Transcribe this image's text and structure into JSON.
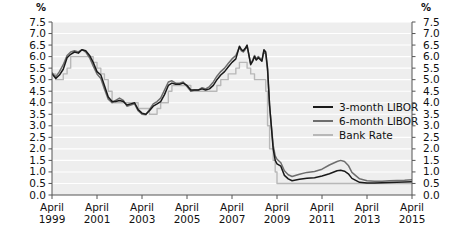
{
  "chart_data": {
    "type": "line",
    "title": "",
    "subtitle": "",
    "xlabel": "",
    "ylabel": "%",
    "ylabel_right": "%",
    "ylim": [
      0.0,
      7.5
    ],
    "xlim": [
      "April 1999",
      "April 2015"
    ],
    "grid": true,
    "legend_position": "inside-right",
    "y_ticks": [
      "7.5",
      "7.0",
      "6.5",
      "6.0",
      "5.5",
      "5.0",
      "4.5",
      "4.0",
      "3.5",
      "3.0",
      "2.5",
      "2.0",
      "1.5",
      "1.0",
      "0.5",
      "0.0"
    ],
    "y_ticks_right": [
      "7.5",
      "7.0",
      "6.5",
      "6.0",
      "5.5",
      "5.0",
      "4.5",
      "4.0",
      "3.5",
      "3.0",
      "2.5",
      "2.0",
      "1.5",
      "1.0",
      "0.5",
      "0.0"
    ],
    "x_ticks": [
      {
        "month": "April",
        "year": "1999"
      },
      {
        "month": "April",
        "year": "2001"
      },
      {
        "month": "April",
        "year": "2003"
      },
      {
        "month": "April",
        "year": "2005"
      },
      {
        "month": "April",
        "year": "2007"
      },
      {
        "month": "April",
        "year": "2009"
      },
      {
        "month": "April",
        "year": "2011"
      },
      {
        "month": "April",
        "year": "2013"
      },
      {
        "month": "April",
        "year": "2015"
      }
    ],
    "colors": {
      "libor_3m": "#1a1a1a",
      "libor_6m": "#6e6e6e",
      "bank_rate": "#b8b8b8",
      "plot_background": "#eeeeee",
      "gridline": "#ffffff",
      "axis": "#555555"
    },
    "x": [
      1999.25,
      1999.42,
      1999.58,
      1999.75,
      1999.92,
      2000.08,
      2000.25,
      2000.42,
      2000.58,
      2000.75,
      2000.92,
      2001.08,
      2001.25,
      2001.42,
      2001.58,
      2001.75,
      2001.92,
      2002.08,
      2002.25,
      2002.42,
      2002.58,
      2002.75,
      2002.92,
      2003.08,
      2003.25,
      2003.42,
      2003.58,
      2003.75,
      2003.92,
      2004.08,
      2004.25,
      2004.42,
      2004.58,
      2004.75,
      2004.92,
      2005.08,
      2005.25,
      2005.42,
      2005.58,
      2005.75,
      2005.92,
      2006.08,
      2006.25,
      2006.42,
      2006.58,
      2006.75,
      2006.92,
      2007.08,
      2007.25,
      2007.42,
      2007.58,
      2007.67,
      2007.75,
      2007.83,
      2007.92,
      2008.08,
      2008.17,
      2008.25,
      2008.33,
      2008.42,
      2008.58,
      2008.67,
      2008.75,
      2008.83,
      2008.92,
      2009.08,
      2009.17,
      2009.25,
      2009.42,
      2009.58,
      2009.75,
      2009.92,
      2010.25,
      2010.58,
      2010.92,
      2011.25,
      2011.58,
      2011.92,
      2012.08,
      2012.25,
      2012.42,
      2012.58,
      2012.92,
      2013.25,
      2013.58,
      2013.92,
      2014.25,
      2014.58,
      2014.92,
      2015.25
    ],
    "series": [
      {
        "name": "3-month LIBOR",
        "color": "#1a1a1a",
        "values": [
          5.25,
          5.05,
          5.2,
          5.45,
          5.95,
          6.1,
          6.2,
          6.15,
          6.3,
          6.25,
          6.05,
          5.75,
          5.35,
          5.2,
          4.75,
          4.25,
          4.05,
          4.05,
          4.1,
          4.05,
          3.9,
          3.95,
          4.0,
          3.7,
          3.55,
          3.5,
          3.65,
          3.85,
          3.95,
          4.05,
          4.35,
          4.75,
          4.85,
          4.8,
          4.8,
          4.85,
          4.75,
          4.55,
          4.55,
          4.55,
          4.6,
          4.55,
          4.6,
          4.75,
          5.0,
          5.2,
          5.35,
          5.55,
          5.75,
          5.9,
          6.45,
          6.3,
          6.25,
          6.35,
          6.5,
          5.65,
          5.8,
          6.0,
          5.85,
          5.95,
          5.8,
          6.3,
          6.2,
          5.5,
          3.9,
          2.0,
          1.5,
          1.35,
          1.25,
          0.85,
          0.7,
          0.62,
          0.68,
          0.73,
          0.75,
          0.82,
          0.92,
          1.05,
          1.07,
          1.03,
          0.92,
          0.72,
          0.55,
          0.52,
          0.52,
          0.53,
          0.54,
          0.55,
          0.56,
          0.57
        ]
      },
      {
        "name": "6-month LIBOR",
        "color": "#6e6e6e",
        "values": [
          5.3,
          5.12,
          5.35,
          5.65,
          6.05,
          6.2,
          6.25,
          6.2,
          6.3,
          6.2,
          5.95,
          5.6,
          5.25,
          5.05,
          4.6,
          4.15,
          4.0,
          4.1,
          4.2,
          4.1,
          3.85,
          3.9,
          3.95,
          3.65,
          3.5,
          3.48,
          3.7,
          3.95,
          4.05,
          4.2,
          4.55,
          4.9,
          4.95,
          4.85,
          4.85,
          4.9,
          4.7,
          4.5,
          4.55,
          4.55,
          4.65,
          4.6,
          4.7,
          4.9,
          5.15,
          5.35,
          5.5,
          5.7,
          5.9,
          6.05,
          6.4,
          6.25,
          6.2,
          6.3,
          6.45,
          5.7,
          5.85,
          6.05,
          5.9,
          6.0,
          5.85,
          6.25,
          6.1,
          5.4,
          3.85,
          2.15,
          1.7,
          1.55,
          1.4,
          1.05,
          0.88,
          0.8,
          0.9,
          0.98,
          1.02,
          1.12,
          1.3,
          1.45,
          1.5,
          1.45,
          1.28,
          0.98,
          0.7,
          0.62,
          0.6,
          0.6,
          0.62,
          0.63,
          0.64,
          0.66
        ]
      },
      {
        "name": "Bank Rate",
        "color": "#b8b8b8",
        "step": true,
        "values": [
          5.25,
          5.0,
          5.0,
          5.25,
          5.5,
          6.0,
          6.0,
          6.0,
          6.0,
          6.0,
          6.0,
          5.75,
          5.5,
          5.25,
          5.0,
          4.5,
          4.0,
          4.0,
          4.0,
          4.0,
          4.0,
          4.0,
          4.0,
          3.75,
          3.75,
          3.75,
          3.5,
          3.5,
          3.75,
          4.0,
          4.0,
          4.5,
          4.75,
          4.75,
          4.75,
          4.75,
          4.75,
          4.5,
          4.5,
          4.5,
          4.5,
          4.5,
          4.5,
          4.5,
          4.75,
          5.0,
          5.0,
          5.25,
          5.25,
          5.5,
          5.75,
          5.75,
          5.75,
          5.75,
          5.5,
          5.25,
          5.25,
          5.0,
          5.0,
          5.0,
          5.0,
          5.0,
          4.5,
          3.0,
          2.0,
          1.5,
          1.0,
          0.5,
          0.5,
          0.5,
          0.5,
          0.5,
          0.5,
          0.5,
          0.5,
          0.5,
          0.5,
          0.5,
          0.5,
          0.5,
          0.5,
          0.5,
          0.5,
          0.5,
          0.5,
          0.5,
          0.5,
          0.5,
          0.5,
          0.5
        ]
      }
    ],
    "legend": [
      {
        "label": "3-month LIBOR",
        "swatch": "sw-3m"
      },
      {
        "label": "6-month LIBOR",
        "swatch": "sw-6m"
      },
      {
        "label": "Bank Rate",
        "swatch": "sw-br"
      }
    ]
  }
}
